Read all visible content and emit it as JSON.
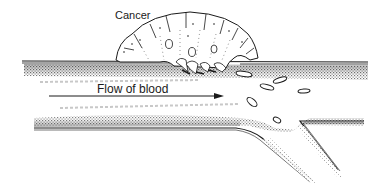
{
  "diagram": {
    "labels": {
      "cancer": "Cancer",
      "flow": "Flow of blood"
    },
    "colors": {
      "ink": "#1a1a1a",
      "shade_dark": "#555555",
      "shade_light": "#bdbdbd",
      "background": "#ffffff"
    },
    "elements": [
      "blood-vessel",
      "branch-vessel",
      "tumor",
      "flow-arrow",
      "detached-cancer-cells"
    ]
  }
}
